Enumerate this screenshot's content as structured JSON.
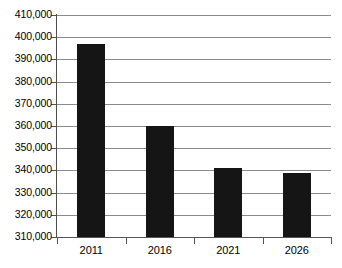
{
  "chart_data": {
    "type": "bar",
    "title": "",
    "subtitle": "",
    "xlabel": "",
    "ylabel": "",
    "categories": [
      "2011",
      "2016",
      "2021",
      "2026"
    ],
    "values": [
      397000,
      360000,
      341000,
      339000
    ],
    "series": [
      {
        "name": "",
        "values": [
          397000,
          360000,
          341000,
          339000
        ]
      }
    ],
    "ylim": [
      310000,
      410000
    ],
    "y_ticks": [
      310000,
      320000,
      330000,
      340000,
      350000,
      360000,
      370000,
      380000,
      390000,
      400000,
      410000
    ],
    "y_tick_labels": [
      "310,000",
      "320,000",
      "330,000",
      "340,000",
      "350,000",
      "360,000",
      "370,000",
      "380,000",
      "390,000",
      "400,000",
      "410,000"
    ],
    "grid": true,
    "grid_axis": "y",
    "legend": false,
    "legend_position": "none",
    "annotations": [],
    "bar_color": "#151515",
    "gridline_color": "#8a8a8a",
    "axis_color": "#555555",
    "background_color": "#ffffff"
  }
}
